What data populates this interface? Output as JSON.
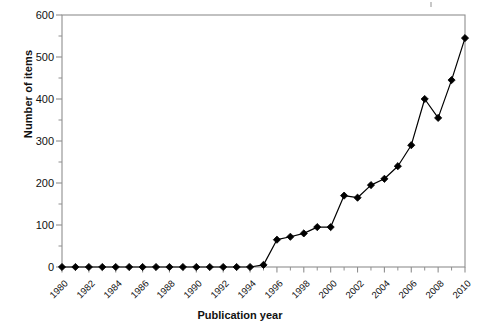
{
  "chart_data": {
    "type": "line",
    "title": "",
    "xlabel": "Publication year",
    "ylabel": "Number of items",
    "x": [
      1980,
      1981,
      1982,
      1983,
      1984,
      1985,
      1986,
      1987,
      1988,
      1989,
      1990,
      1991,
      1992,
      1993,
      1994,
      1995,
      1996,
      1997,
      1998,
      1999,
      2000,
      2001,
      2002,
      2003,
      2004,
      2005,
      2006,
      2007,
      2008,
      2009,
      2010
    ],
    "values": [
      0,
      0,
      0,
      0,
      0,
      0,
      0,
      0,
      0,
      0,
      0,
      0,
      0,
      0,
      0,
      5,
      65,
      72,
      80,
      95,
      95,
      170,
      165,
      195,
      210,
      240,
      290,
      400,
      355,
      445,
      545
    ],
    "series": [
      {
        "name": "Number of items",
        "values": [
          0,
          0,
          0,
          0,
          0,
          0,
          0,
          0,
          0,
          0,
          0,
          0,
          0,
          0,
          0,
          5,
          65,
          72,
          80,
          95,
          95,
          170,
          165,
          195,
          210,
          240,
          290,
          400,
          355,
          445,
          545
        ]
      }
    ],
    "xlim": [
      1980,
      2010
    ],
    "ylim": [
      0,
      600
    ],
    "ytick_values": [
      0,
      100,
      200,
      300,
      400,
      500,
      600
    ],
    "ytick_labels": [
      "0",
      "100",
      "200",
      "300",
      "400",
      "500",
      "600"
    ],
    "yminor_interval": 50,
    "xtick_values": [
      1980,
      1982,
      1984,
      1986,
      1988,
      1990,
      1992,
      1994,
      1996,
      1998,
      2000,
      2002,
      2004,
      2006,
      2008,
      2010
    ],
    "xtick_labels": [
      "1980",
      "1982",
      "1984",
      "1986",
      "1988",
      "1990",
      "1992",
      "1994",
      "1996",
      "1998",
      "2000",
      "2002",
      "2004",
      "2006",
      "2008",
      "2010"
    ],
    "grid": false,
    "legend": "none",
    "marker": "diamond",
    "marker_color": "#000000",
    "line_color": "#000000",
    "frame_color": "#8f8f8f",
    "annotations": []
  }
}
